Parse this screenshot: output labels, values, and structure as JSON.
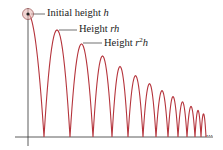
{
  "figure": {
    "colors": {
      "curve": "#b5343c",
      "axis": "#333333",
      "marker_fill": "#e8b9b5",
      "marker_stroke": "#8a3a3a",
      "text": "#222222"
    },
    "labels": [
      {
        "id": "initial",
        "prefix": "Initial height ",
        "var": "h",
        "x": 47,
        "y": 8,
        "target_x": 31,
        "target_y": 14
      },
      {
        "id": "rh",
        "prefix": "Height ",
        "var": "rh",
        "x": 79,
        "y": 24,
        "target_x": 59,
        "target_y": 30
      },
      {
        "id": "r2h",
        "prefix": "Height ",
        "var": "r2h",
        "x": 104,
        "y": 38,
        "target_x": 83,
        "target_y": 43
      }
    ],
    "continuation": "...",
    "axes": {
      "origin": {
        "x": 28,
        "y": 137
      },
      "x_end": 213,
      "y_top": 8,
      "y_bottom": 146,
      "x_start": 15
    },
    "bounces": {
      "start_x": 28,
      "ground_y": 137,
      "initial_peak_y": 14,
      "ratio": 0.87,
      "ground_contacts_x": [
        44,
        70,
        93,
        112,
        128,
        143,
        156,
        168,
        178,
        187,
        195,
        201,
        206
      ]
    }
  }
}
